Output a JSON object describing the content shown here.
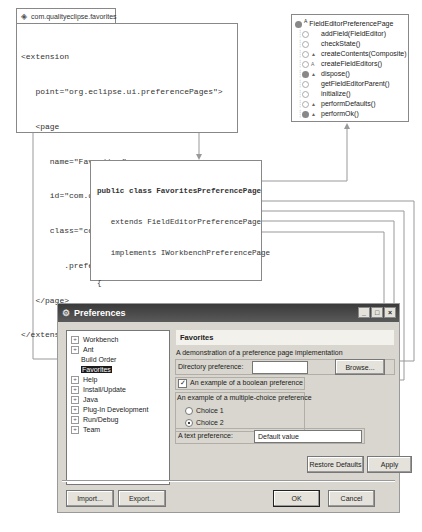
{
  "xml": {
    "tab_label": "com.qualityeclipse.favorites",
    "lines": [
      "<extension",
      "   point=\"org.eclipse.ui.preferencePages\">",
      "   <page",
      "      name=\"Favorites\"",
      "      id=\"com.qualityeclipse.favorites.prefs.view\"",
      "      class=\"com.qualityeclipse.favorites",
      "         .preferences.FavoritesPreferencePage\">",
      "   </page>",
      "</extension>"
    ]
  },
  "outline": {
    "title": "FieldEditorPreferencePage",
    "members": [
      {
        "name": "addField(FieldEditor)",
        "marker": ""
      },
      {
        "name": "checkState()",
        "marker": ""
      },
      {
        "name": "createContents(Composite)",
        "marker": "▲"
      },
      {
        "name": "createFieldEditors()",
        "marker": "A"
      },
      {
        "name": "dispose()",
        "marker": "▲"
      },
      {
        "name": "getFieldEditorParent()",
        "marker": ""
      },
      {
        "name": "initialize()",
        "marker": ""
      },
      {
        "name": "performDefaults()",
        "marker": "▲"
      },
      {
        "name": "performOk()",
        "marker": "▲"
      },
      {
        "name": "setVisible(boolean)",
        "marker": "▲"
      }
    ]
  },
  "code": {
    "lines": [
      "public class FavoritesPreferencePage",
      "   extends FieldEditorPreferencePage",
      "   implements IWorkbenchPreferencePage",
      "{",
      "   public void createFieldEditors() {",
      "      addField(new DirectoryFieldEditor(...",
      "      addField(new BooleanFieldEditor(...",
      "      addField(new RadioGroupFieldEditor(...",
      "      addField(new StringFieldEditor(...",
      "   }",
      "   ..."
    ]
  },
  "dialog": {
    "title": "Preferences",
    "window_buttons": [
      "_",
      "□",
      "×"
    ],
    "tree": [
      {
        "label": "Workbench",
        "expandable": true
      },
      {
        "label": "Ant",
        "expandable": true
      },
      {
        "label": "Build Order",
        "expandable": false
      },
      {
        "label": "Favorites",
        "expandable": false,
        "selected": true
      },
      {
        "label": "Help",
        "expandable": true
      },
      {
        "label": "Install/Update",
        "expandable": true
      },
      {
        "label": "Java",
        "expandable": true
      },
      {
        "label": "Plug-In Development",
        "expandable": true
      },
      {
        "label": "Run/Debug",
        "expandable": true
      },
      {
        "label": "Team",
        "expandable": true
      }
    ],
    "page_title": "Favorites",
    "description": "A demonstration of a preference page implementation",
    "directory_label": "Directory preference:",
    "directory_value": "",
    "browse_label": "Browse...",
    "boolean_label": "An example of a boolean preference",
    "boolean_checked": true,
    "radio_group_label": "An example of a multiple-choice preference",
    "choices": [
      {
        "label": "Choice 1",
        "selected": false
      },
      {
        "label": "Choice 2",
        "selected": true
      }
    ],
    "text_label": "A text preference:",
    "text_value": "Default value",
    "restore_defaults_label": "Restore Defaults",
    "apply_label": "Apply",
    "import_label": "Import...",
    "export_label": "Export...",
    "ok_label": "OK",
    "cancel_label": "Cancel"
  }
}
